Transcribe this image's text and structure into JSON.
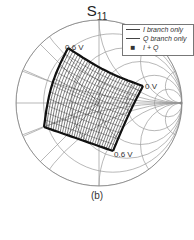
{
  "chart_data": {
    "type": "scatter",
    "chart_kind": "smith-chart",
    "title": "S11",
    "title_main": "S",
    "title_sub": "11",
    "xlabel": "",
    "ylabel": "",
    "grid": true,
    "legend_position": "upper-right",
    "series": [
      {
        "name": "I branch only",
        "style": "line"
      },
      {
        "name": "Q branch only",
        "style": "line"
      },
      {
        "name": "I + Q",
        "style": "dots"
      }
    ],
    "annotations": [
      {
        "text": "0.6 V",
        "position": "upper-left corner of constellation"
      },
      {
        "text": "0 V",
        "position": "right corner of constellation"
      },
      {
        "text": "0.6 V",
        "position": "lower corner of constellation"
      }
    ],
    "caption": "(b)",
    "region_description": "Dense quadrilateral-shaped grid of S11 points spanning the left/center of the Smith chart, from ~0.6 V (upper-left) to 0 V (right)"
  },
  "legend": {
    "items": [
      {
        "label": "I branch only",
        "marker": "line"
      },
      {
        "label": "Q branch only",
        "marker": "line"
      },
      {
        "label": "I + Q",
        "marker": "dot"
      }
    ]
  },
  "annotations": {
    "top_left": "0.6 V",
    "right": "0 V",
    "bottom": "0.6 V"
  },
  "caption": "(b)",
  "colors": {
    "grid": "#9a9a9a",
    "data": "#111111",
    "background": "#ffffff"
  }
}
